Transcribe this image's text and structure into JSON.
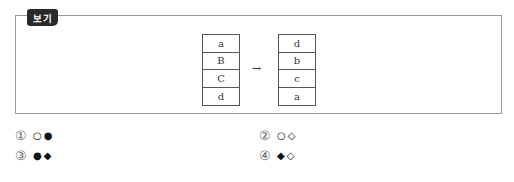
{
  "label": "보기",
  "diagram": {
    "left_stack": [
      "a",
      "B",
      "C",
      "d"
    ],
    "arrow": "→",
    "right_stack": [
      "d",
      "b",
      "c",
      "a"
    ]
  },
  "options": [
    {
      "num": "①",
      "symbols": "○●"
    },
    {
      "num": "②",
      "symbols": "○◇"
    },
    {
      "num": "③",
      "symbols": "●◆"
    },
    {
      "num": "④",
      "symbols": "◆◇"
    }
  ]
}
